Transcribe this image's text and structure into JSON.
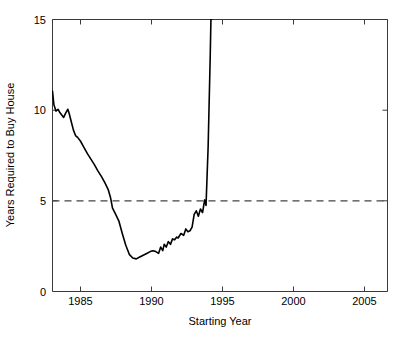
{
  "chart_data": {
    "type": "line",
    "title": "",
    "xlabel": "Starting Year",
    "ylabel": "Years Required to Buy House",
    "xlim": [
      1983.0,
      2007.0
    ],
    "ylim": [
      0,
      15
    ],
    "xticks": [
      1985,
      1990,
      1995,
      2000,
      2005
    ],
    "xtick_labels": [
      "1985",
      "1990",
      "1995",
      "2000",
      "2005"
    ],
    "yticks": [
      0,
      5,
      10,
      15
    ],
    "ytick_labels": [
      "0",
      "5",
      "10",
      "15"
    ],
    "grid": false,
    "legend": "none",
    "series": [
      {
        "name": "Years Required to Buy House",
        "style": "solid",
        "color": "#000000",
        "x": [
          1983.0,
          1983.1,
          1983.25,
          1983.4,
          1983.5,
          1983.65,
          1983.8,
          1983.95,
          1984.1,
          1984.2,
          1984.35,
          1984.5,
          1984.65,
          1984.8,
          1985.0,
          1985.25,
          1985.5,
          1985.75,
          1986.0,
          1986.25,
          1986.5,
          1986.75,
          1987.0,
          1987.15,
          1987.3,
          1987.5,
          1987.75,
          1988.0,
          1988.25,
          1988.5,
          1988.75,
          1989.0,
          1989.25,
          1989.5,
          1989.75,
          1990.0,
          1990.2,
          1990.4,
          1990.6,
          1990.75,
          1990.9,
          1991.0,
          1991.15,
          1991.3,
          1991.45,
          1991.6,
          1991.75,
          1991.9,
          1992.0,
          1992.2,
          1992.4,
          1992.55,
          1992.7,
          1992.85,
          1993.0,
          1993.15,
          1993.3,
          1993.45,
          1993.6,
          1993.75,
          1993.9,
          1994.0,
          1994.15,
          1994.3,
          1994.35,
          1994.4
        ],
        "y": [
          11.05,
          10.3,
          9.95,
          10.05,
          9.9,
          9.75,
          9.6,
          9.85,
          10.05,
          9.8,
          9.35,
          8.9,
          8.6,
          8.5,
          8.3,
          7.95,
          7.6,
          7.3,
          7.0,
          6.65,
          6.35,
          6.0,
          5.6,
          5.2,
          4.6,
          4.3,
          3.9,
          3.2,
          2.55,
          2.05,
          1.85,
          1.8,
          1.9,
          2.0,
          2.1,
          2.2,
          2.25,
          2.2,
          2.1,
          2.45,
          2.25,
          2.6,
          2.45,
          2.75,
          2.6,
          2.9,
          2.85,
          3.0,
          2.95,
          3.2,
          3.1,
          3.45,
          3.3,
          3.35,
          3.55,
          4.25,
          4.45,
          4.15,
          4.55,
          4.35,
          5.05,
          4.75,
          8.0,
          13.0,
          15.0,
          15.0
        ]
      },
      {
        "name": "threshold-5-years",
        "style": "dashed",
        "color": "#444444",
        "x": [
          1983.0,
          2007.0
        ],
        "y": [
          5,
          5
        ]
      }
    ],
    "annotations": []
  },
  "axes": {
    "x_axis_title": "Starting Year",
    "y_axis_title": "Years Required to Buy House"
  }
}
